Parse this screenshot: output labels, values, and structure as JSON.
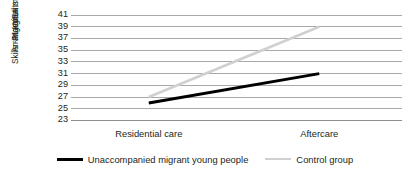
{
  "chart_data": {
    "type": "line",
    "title": "",
    "xlabel": "",
    "ylabel_lines": [
      "Marginal mean scores in Daily",
      "Arrangements and Organizational",
      "Skills -PLANEA"
    ],
    "ylabel": "Marginal mean scores in Daily Arrangements and Organizational Skills -PLANEA",
    "categories": [
      "Residential care",
      "Aftercare"
    ],
    "series": [
      {
        "name": "Unaccompanied migrant young people",
        "values": [
          26,
          31
        ],
        "color": "#000000",
        "width": 3
      },
      {
        "name": "Control group",
        "values": [
          27,
          39
        ],
        "color": "#d0d0d0",
        "width": 2.6
      }
    ],
    "ylim": [
      23,
      41
    ],
    "yticks": [
      41,
      39,
      37,
      35,
      33,
      31,
      29,
      27,
      25,
      23
    ],
    "ytick_labels": [
      "41",
      "39",
      "37",
      "35",
      "33",
      "31",
      "29",
      "27",
      "25",
      "23"
    ],
    "grid": true,
    "grid_color": "#a9a9a9",
    "legend_position": "bottom"
  },
  "legend": {
    "entries": [
      {
        "label": "Unaccompanied migrant young people",
        "color": "#000000"
      },
      {
        "label": "Control group",
        "color": "#d0d0d0"
      }
    ]
  },
  "colors": {
    "background": "#ffffff",
    "text": "#231f20",
    "grid": "#a9a9a9",
    "series_primary": "#000000",
    "series_secondary": "#d0d0d0"
  }
}
